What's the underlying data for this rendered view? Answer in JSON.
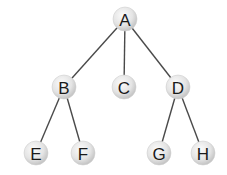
{
  "diagram": {
    "type": "tree",
    "colors": {
      "node_fill_light": "#f7f7f7",
      "node_fill_dark": "#c8c8c8",
      "edge": "#4a4a4a",
      "label": "#1a1a1a"
    },
    "nodes": [
      {
        "id": "A",
        "label": "A",
        "x": 125,
        "y": 19
      },
      {
        "id": "B",
        "label": "B",
        "x": 64,
        "y": 87
      },
      {
        "id": "C",
        "label": "C",
        "x": 124,
        "y": 87
      },
      {
        "id": "D",
        "label": "D",
        "x": 178,
        "y": 87
      },
      {
        "id": "E",
        "label": "E",
        "x": 36,
        "y": 153
      },
      {
        "id": "F",
        "label": "F",
        "x": 83,
        "y": 153
      },
      {
        "id": "G",
        "label": "G",
        "x": 159,
        "y": 153
      },
      {
        "id": "H",
        "label": "H",
        "x": 203,
        "y": 153
      }
    ],
    "edges": [
      {
        "from": "A",
        "to": "B"
      },
      {
        "from": "A",
        "to": "C"
      },
      {
        "from": "A",
        "to": "D"
      },
      {
        "from": "B",
        "to": "E"
      },
      {
        "from": "B",
        "to": "F"
      },
      {
        "from": "D",
        "to": "G"
      },
      {
        "from": "D",
        "to": "H"
      }
    ]
  }
}
